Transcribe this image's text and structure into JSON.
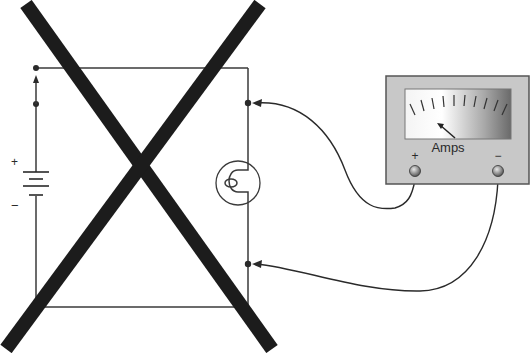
{
  "diagram": {
    "battery": {
      "positive_label": "+",
      "negative_label": "−"
    },
    "ammeter": {
      "unit_label": "Amps",
      "positive_terminal_label": "+",
      "negative_terminal_label": "−",
      "case_color": "#c8c8c8",
      "scale_tick_count": 10
    },
    "components": [
      "battery",
      "switch",
      "lamp",
      "ammeter",
      "test leads"
    ],
    "overlay": {
      "type": "X",
      "meaning": "incorrect",
      "color": "#1a1a1a"
    }
  }
}
